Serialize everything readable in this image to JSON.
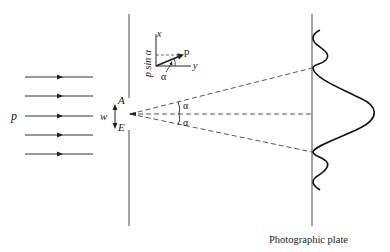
{
  "figure": {
    "type": "single-slit diffraction diagram",
    "incident_label": "p",
    "slit_width_label": "w",
    "slit_edge_top": "A",
    "slit_edge_bottom": "E",
    "angle_label_upper": "α",
    "angle_label_lower": "α",
    "plate_label": "Photographic plate",
    "inset": {
      "x_axis_label": "x",
      "y_axis_label": "y",
      "momentum_label": "p",
      "component_label": "p sin α",
      "angle_label": "α"
    },
    "colors": {
      "stroke": "#222222",
      "wall": "#555555",
      "background": "#ffffff"
    }
  }
}
